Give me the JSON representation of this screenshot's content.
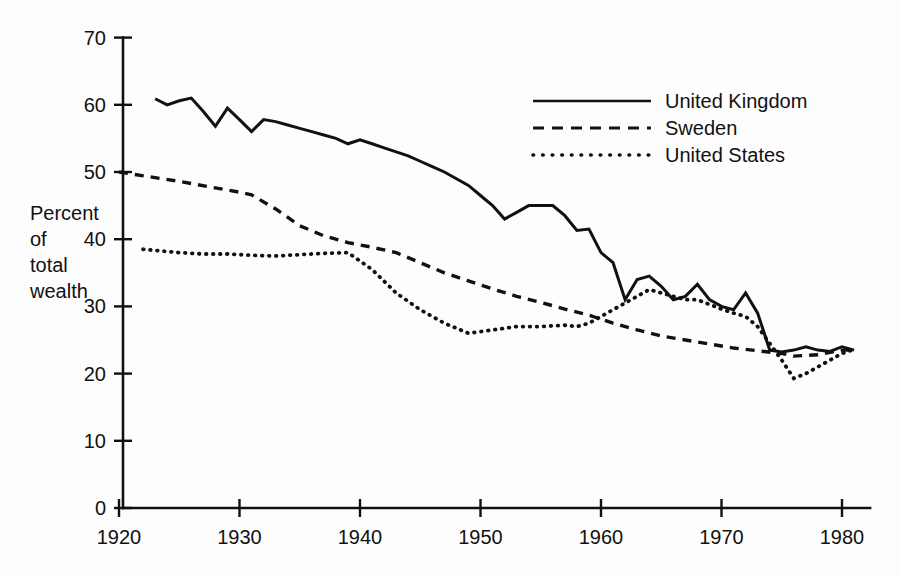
{
  "chart_data": {
    "type": "line",
    "title": "",
    "subtitle": "",
    "xlabel": "",
    "ylabel": "Percent of total wealth",
    "ylabel_lines": [
      "Percent",
      "of",
      "total",
      "wealth"
    ],
    "xlim": [
      1920,
      1982
    ],
    "ylim": [
      0,
      70
    ],
    "x_ticks": [
      1920,
      1930,
      1940,
      1950,
      1960,
      1970,
      1980
    ],
    "x_tick_labels": [
      "1920",
      "1930",
      "1940",
      "1950",
      "1960",
      "1970",
      "1980"
    ],
    "y_ticks": [
      0,
      10,
      20,
      30,
      40,
      50,
      60,
      70
    ],
    "y_tick_labels": [
      "0",
      "10",
      "20",
      "30",
      "40",
      "50",
      "60",
      "70"
    ],
    "grid": false,
    "legend_position": "top-right",
    "legend_entries": [
      "United Kingdom",
      "Sweden",
      "United States"
    ],
    "series": [
      {
        "name": "United Kingdom",
        "style": "solid",
        "color": "#111111",
        "x": [
          1923,
          1924,
          1925,
          1926,
          1927,
          1928,
          1929,
          1930,
          1931,
          1932,
          1933,
          1934,
          1935,
          1936,
          1937,
          1938,
          1939,
          1940,
          1941,
          1942,
          1943,
          1944,
          1945,
          1946,
          1947,
          1948,
          1949,
          1950,
          1951,
          1952,
          1953,
          1954,
          1955,
          1956,
          1957,
          1958,
          1959,
          1960,
          1961,
          1962,
          1963,
          1964,
          1965,
          1966,
          1967,
          1968,
          1969,
          1970,
          1971,
          1972,
          1973,
          1974,
          1975,
          1976,
          1977,
          1978,
          1979,
          1980,
          1981
        ],
        "y": [
          60.9,
          60.0,
          60.6,
          61.0,
          59.0,
          56.8,
          59.5,
          57.8,
          56.0,
          57.8,
          57.5,
          57.0,
          56.5,
          56.0,
          55.5,
          55.0,
          54.2,
          54.8,
          54.2,
          53.6,
          53.0,
          52.4,
          51.6,
          50.8,
          50.0,
          49.0,
          48.0,
          46.5,
          45.0,
          43.0,
          44.0,
          45.0,
          45.0,
          45.0,
          43.5,
          41.3,
          41.5,
          38.0,
          36.5,
          31.0,
          34.0,
          34.5,
          33.0,
          31.0,
          31.5,
          33.3,
          31.0,
          30.0,
          29.5,
          32.0,
          29.0,
          23.5,
          23.2,
          23.5,
          24.0,
          23.5,
          23.3,
          24.0,
          23.5
        ]
      },
      {
        "name": "Sweden",
        "style": "dashed",
        "color": "#111111",
        "x": [
          1920,
          1925,
          1930,
          1931,
          1933,
          1935,
          1937,
          1939,
          1941,
          1943,
          1945,
          1947,
          1949,
          1951,
          1953,
          1955,
          1957,
          1959,
          1961,
          1963,
          1965,
          1967,
          1969,
          1971,
          1973,
          1975,
          1976,
          1978,
          1980,
          1981
        ],
        "y": [
          50.0,
          48.6,
          47.0,
          46.6,
          44.5,
          42.0,
          40.5,
          39.5,
          38.8,
          38.0,
          36.5,
          35.0,
          33.8,
          32.6,
          31.5,
          30.6,
          29.6,
          28.7,
          27.5,
          26.5,
          25.6,
          25.0,
          24.4,
          23.8,
          23.4,
          23.0,
          22.6,
          22.8,
          23.5,
          23.5
        ]
      },
      {
        "name": "United States",
        "style": "dotted",
        "color": "#111111",
        "x": [
          1922,
          1925,
          1927,
          1929,
          1931,
          1933,
          1935,
          1937,
          1939,
          1941,
          1943,
          1945,
          1947,
          1949,
          1951,
          1953,
          1955,
          1957,
          1958,
          1959,
          1960,
          1961,
          1962,
          1963,
          1964,
          1965,
          1966,
          1967,
          1968,
          1969,
          1970,
          1971,
          1972,
          1973,
          1974,
          1975,
          1976,
          1977,
          1978,
          1980,
          1981
        ],
        "y": [
          38.5,
          38.0,
          37.8,
          37.8,
          37.6,
          37.5,
          37.7,
          37.9,
          38.0,
          35.5,
          32.0,
          29.5,
          27.5,
          26.0,
          26.5,
          27.0,
          27.0,
          27.2,
          27.0,
          27.5,
          28.5,
          29.5,
          30.5,
          31.5,
          32.5,
          32.0,
          31.5,
          31.0,
          31.0,
          30.3,
          29.6,
          29.0,
          28.5,
          27.0,
          24.5,
          22.0,
          19.3,
          20.0,
          21.0,
          23.0,
          23.6
        ]
      }
    ]
  },
  "legend": {
    "items": [
      {
        "label": "United Kingdom",
        "style": "solid"
      },
      {
        "label": "Sweden",
        "style": "dashed"
      },
      {
        "label": "United States",
        "style": "dotted"
      }
    ]
  },
  "colors": {
    "ink": "#111111",
    "background": "#fdfdfd"
  }
}
